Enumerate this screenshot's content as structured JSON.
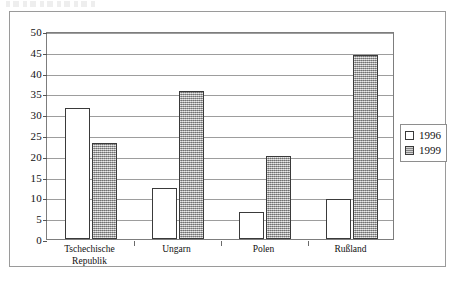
{
  "figure": {
    "scan_artifact_text": ""
  },
  "legend": {
    "position": "right",
    "entries": [
      {
        "label": "1996",
        "swatch": "white-square-icon"
      },
      {
        "label": "1999",
        "swatch": "gray-square-icon"
      }
    ]
  },
  "axis": {
    "y_ticks": [
      "50",
      "45",
      "40",
      "35",
      "30",
      "25",
      "20",
      "15",
      "10",
      "5",
      "0"
    ]
  },
  "chart_data": {
    "type": "bar",
    "title": "",
    "subtitle": "",
    "xlabel": "",
    "ylabel": "",
    "ylim": [
      0,
      50
    ],
    "ytick_step": 5,
    "grid": true,
    "legend_position": "right",
    "categories": [
      "Tschechische Republik",
      "Ungarn",
      "Polen",
      "Rußland"
    ],
    "category_lines": [
      [
        "Tschechische",
        "Republik"
      ],
      [
        "Ungarn"
      ],
      [
        "Polen"
      ],
      [
        "Rußland"
      ]
    ],
    "series": [
      {
        "name": "1996",
        "color": "#ffffff",
        "values": [
          31.5,
          12.3,
          6.6,
          9.7
        ]
      },
      {
        "name": "1999",
        "color": "#a8a8a8",
        "values": [
          23.0,
          35.5,
          20.0,
          44.2
        ]
      }
    ]
  }
}
